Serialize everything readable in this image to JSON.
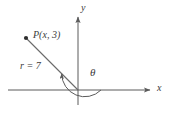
{
  "figure": {
    "background_color": "#ffffff",
    "line_color": "#5a5a5a",
    "text_color": "#3b3b3b"
  },
  "axes": {
    "x_axis": {
      "label": "x",
      "label_x": 157,
      "label_y": 83,
      "start_x": 8,
      "end_x": 152,
      "y": 90,
      "arrow": "right"
    },
    "y_axis": {
      "label": "y",
      "label_x": 81,
      "label_y": 3,
      "x": 78,
      "start_y": 105,
      "end_y": 15,
      "arrow": "up"
    },
    "origin": {
      "x": 78,
      "y": 90
    }
  },
  "point": {
    "label": "P(x, 3)",
    "dot_x": 26,
    "dot_y": 38,
    "label_x": 33,
    "label_y": 30,
    "coordinates": {
      "x": "x",
      "y": 3
    }
  },
  "ray": {
    "label": "r = 7",
    "length_value": 7,
    "label_x": 20,
    "label_y": 61,
    "from_x": 78,
    "from_y": 90,
    "to_x": 26,
    "to_y": 38
  },
  "angle": {
    "label": "θ",
    "label_x": 90,
    "label_y": 67,
    "arc_radius": 23,
    "start_angle_deg": 0,
    "end_angle_deg": 135,
    "direction": "counterclockwise",
    "arrowhead": "at-terminal-side"
  }
}
